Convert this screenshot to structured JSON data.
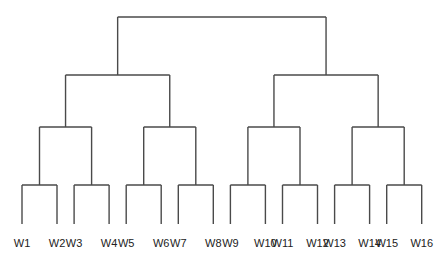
{
  "chart_data": {
    "type": "dendrogram",
    "title": "",
    "leaves": [
      "W1",
      "W2",
      "W3",
      "W4",
      "W5",
      "W6",
      "W7",
      "W8",
      "W9",
      "W10",
      "W11",
      "W12",
      "W13",
      "W14",
      "W15",
      "W16"
    ],
    "levels": 4,
    "tree": {
      "height": 4,
      "children": [
        {
          "height": 3,
          "children": [
            {
              "height": 2,
              "children": [
                {
                  "height": 1,
                  "children": [
                    "W1",
                    "W2"
                  ]
                },
                {
                  "height": 1,
                  "children": [
                    "W3",
                    "W4"
                  ]
                }
              ]
            },
            {
              "height": 2,
              "children": [
                {
                  "height": 1,
                  "children": [
                    "W5",
                    "W6"
                  ]
                },
                {
                  "height": 1,
                  "children": [
                    "W7",
                    "W8"
                  ]
                }
              ]
            }
          ]
        },
        {
          "height": 3,
          "children": [
            {
              "height": 2,
              "children": [
                {
                  "height": 1,
                  "children": [
                    "W9",
                    "W10"
                  ]
                },
                {
                  "height": 1,
                  "children": [
                    "W11",
                    "W12"
                  ]
                }
              ]
            },
            {
              "height": 2,
              "children": [
                {
                  "height": 1,
                  "children": [
                    "W13",
                    "W14"
                  ]
                },
                {
                  "height": 1,
                  "children": [
                    "W15",
                    "W16"
                  ]
                }
              ]
            }
          ]
        }
      ]
    },
    "line_color": "#4a4a4a"
  }
}
